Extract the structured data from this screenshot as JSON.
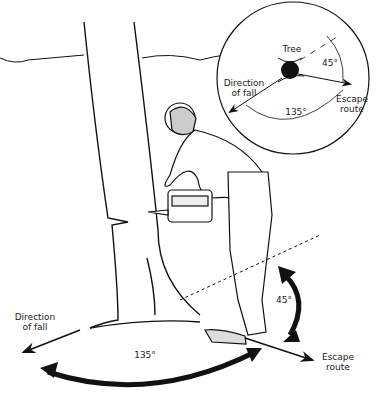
{
  "diagram": {
    "main_labels": {
      "direction_of_fall": "Direction\nof fall",
      "escape_route": "Escape\nroute",
      "angle_large": "135°",
      "angle_small": "45°"
    },
    "inset": {
      "tree": "Tree",
      "direction_of_fall": "Direction\nof fall",
      "escape_route": "Escape\nroute",
      "angle_large": "135°",
      "angle_small": "45°"
    },
    "colors": {
      "line": "#111111",
      "background": "#ffffff"
    }
  }
}
